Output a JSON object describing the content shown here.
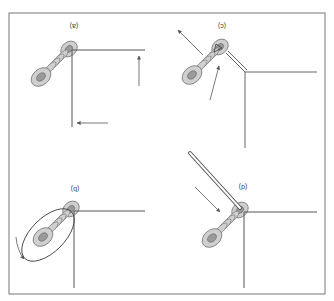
{
  "diagram": {
    "orientation": "rotated-180",
    "panels": [
      {
        "id": "a",
        "label": "(a)",
        "position": "top-left-displayed",
        "description": "Wire passed through insulator eye, two direction arrows"
      },
      {
        "id": "c",
        "label": "(c)",
        "position": "top-right-displayed",
        "description": "Double wire bent around corner, tension arrows"
      },
      {
        "id": "b",
        "label": "(b)",
        "position": "bottom-left-displayed",
        "description": "Loop wrapped around insulator, curved rotation arrow"
      },
      {
        "id": "d",
        "label": "(d)",
        "position": "bottom-right-displayed",
        "description": "Tool/rod inserted into insulator eye, push arrow"
      }
    ],
    "colors": {
      "line": "#555555",
      "insulator_fill": "#c8c8c8",
      "insulator_dark": "#8a8a8a",
      "frame": "#777777",
      "background": "#ffffff"
    }
  }
}
